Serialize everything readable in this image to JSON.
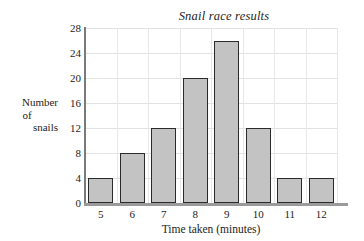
{
  "chart_data": {
    "type": "bar",
    "title": "Snail race results",
    "xlabel": "Time taken (minutes)",
    "ylabel": "Number of snails",
    "ylabel_lines": [
      "Number",
      "of",
      "snails"
    ],
    "categories": [
      "5",
      "6",
      "7",
      "8",
      "9",
      "10",
      "11",
      "12"
    ],
    "values": [
      4,
      8,
      12,
      20,
      26,
      12,
      4,
      4
    ],
    "yticks": [
      0,
      4,
      8,
      12,
      16,
      20,
      24,
      28
    ],
    "ylim": [
      0,
      28
    ],
    "grid": true,
    "legend": false,
    "bar_fill_color": "#c3c3c3",
    "bar_edge_color": "#2b2b2b",
    "gridline_color": "#e2e2e2",
    "axis_color": "#7a7a7a"
  }
}
